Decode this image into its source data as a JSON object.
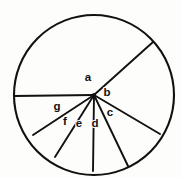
{
  "figure": {
    "type": "geometry-diagram",
    "stroke_color": "#111111",
    "background_color": "#fdfdfc",
    "circle": {
      "center_x": 94,
      "center_y": 95,
      "radius": 80,
      "stroke_width": 2.1
    },
    "vertex": {
      "name": "common-vertex",
      "x": 94,
      "y": 95
    },
    "radii": [
      {
        "id": "radius-left",
        "end_x": 14,
        "end_y": 96,
        "angle_deg": 180.7
      },
      {
        "id": "radius-upper-right",
        "end_x": 153,
        "end_y": 42,
        "angle_deg": 40.3
      },
      {
        "id": "radius-right-lower",
        "end_x": 160,
        "end_y": 134,
        "angle_deg": -30.4
      },
      {
        "id": "radius-bottom-right",
        "end_x": 128,
        "end_y": 166,
        "angle_deg": -64.4
      },
      {
        "id": "radius-bottom",
        "end_x": 93,
        "end_y": 171,
        "angle_deg": -90.8
      },
      {
        "id": "radius-bottom-left",
        "end_x": 55,
        "end_y": 157,
        "angle_deg": -123.8
      },
      {
        "id": "radius-left-lower",
        "end_x": 33,
        "end_y": 135,
        "angle_deg": -155.7
      }
    ],
    "labels": [
      {
        "id": "label-a",
        "text": "a",
        "x": 88,
        "y": 78
      },
      {
        "id": "label-b",
        "text": "b",
        "x": 107,
        "y": 93
      },
      {
        "id": "label-c",
        "text": "c",
        "x": 110,
        "y": 113
      },
      {
        "id": "label-d",
        "text": "d",
        "x": 95,
        "y": 124
      },
      {
        "id": "label-e",
        "text": "e",
        "x": 79,
        "y": 124
      },
      {
        "id": "label-f",
        "text": "f",
        "x": 65,
        "y": 122
      },
      {
        "id": "label-g",
        "text": "g",
        "x": 57,
        "y": 107
      }
    ]
  }
}
